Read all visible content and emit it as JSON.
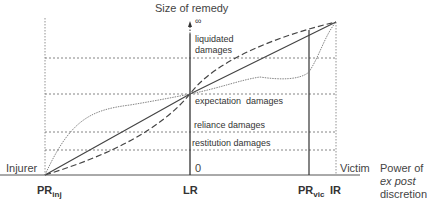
{
  "diagram": {
    "y_axis_title": "Size of remedy",
    "infinity_symbol": "∞",
    "origin_label": "0",
    "x_axis_title_line1": "Power of",
    "x_axis_title_line2": "ex post",
    "x_axis_title_line3": "discretion",
    "left_end_label": "Injurer",
    "right_end_label": "Victim",
    "x_points": [
      {
        "main": "PR",
        "sub": "inj"
      },
      {
        "main": "LR",
        "sub": ""
      },
      {
        "main": "PR",
        "sub": "vic"
      },
      {
        "main": "IR",
        "sub": ""
      }
    ],
    "remedy_levels": [
      {
        "label_line1": "liquidated",
        "label_line2": "damages"
      },
      {
        "label_line1": "expectation  damages",
        "label_line2": ""
      },
      {
        "label_line1": "reliance damages",
        "label_line2": ""
      },
      {
        "label_line1": "restitution damages",
        "label_line2": ""
      }
    ],
    "curves": [
      {
        "name": "solid-line",
        "style": "solid"
      },
      {
        "name": "dashed-curve",
        "style": "dashed"
      },
      {
        "name": "dotted-curve",
        "style": "dotted"
      }
    ]
  }
}
